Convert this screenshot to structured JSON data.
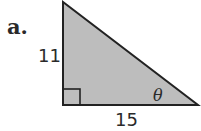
{
  "problem": {
    "label": "a.",
    "side_vertical": "11",
    "side_horizontal": "15",
    "angle_label": "θ"
  },
  "colors": {
    "fill": "#bdbdbd",
    "stroke": "#222222"
  }
}
